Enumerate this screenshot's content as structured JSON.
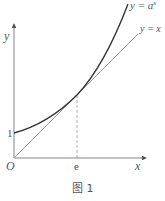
{
  "figure": {
    "caption": "图 1",
    "axis_x_label": "x",
    "axis_y_label": "y",
    "origin_label": "O",
    "tick_x_label": "e",
    "tick_y_label": "1",
    "curve_label": "y = a",
    "curve_label_sup": "x",
    "line_label": "y = x",
    "colors": {
      "curve": "#333333",
      "line": "#888888",
      "axis": "#555555",
      "dashed": "#888888"
    }
  }
}
